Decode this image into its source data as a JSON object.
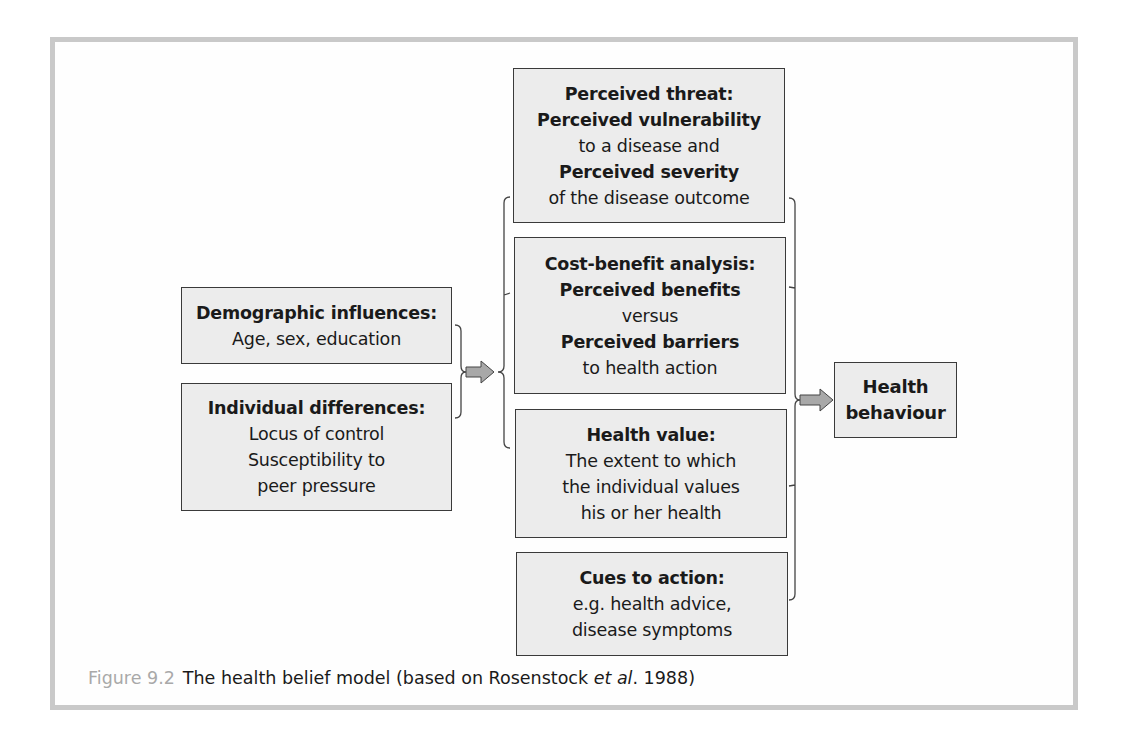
{
  "diagram": {
    "left_boxes": [
      {
        "title": "Demographic influences:",
        "lines": [
          "Age, sex, education"
        ]
      },
      {
        "title": "Individual differences:",
        "lines": [
          "Locus of control",
          "Susceptibility to",
          "peer pressure"
        ]
      }
    ],
    "middle_boxes": [
      {
        "lines": [
          {
            "text": "Perceived threat:",
            "bold": true
          },
          {
            "text": "Perceived vulnerability",
            "bold": true
          },
          {
            "text": "to a disease and",
            "bold": false
          },
          {
            "text": "Perceived severity",
            "bold": true
          },
          {
            "text": "of the disease outcome",
            "bold": false
          }
        ]
      },
      {
        "lines": [
          {
            "text": "Cost-benefit analysis:",
            "bold": true
          },
          {
            "text": "Perceived benefits",
            "bold": true
          },
          {
            "text": "versus",
            "bold": false
          },
          {
            "text": "Perceived barriers",
            "bold": true
          },
          {
            "text": "to health action",
            "bold": false
          }
        ]
      },
      {
        "lines": [
          {
            "text": "Health value:",
            "bold": true
          },
          {
            "text": "The extent to which",
            "bold": false
          },
          {
            "text": "the individual values",
            "bold": false
          },
          {
            "text": "his or her health",
            "bold": false
          }
        ]
      },
      {
        "lines": [
          {
            "text": "Cues to action:",
            "bold": true
          },
          {
            "text": "e.g. health advice,",
            "bold": false
          },
          {
            "text": "disease symptoms",
            "bold": false
          }
        ]
      }
    ],
    "outcome_box": {
      "lines": [
        "Health",
        "behaviour"
      ]
    },
    "arrows": [
      {
        "from": "left_boxes",
        "to": "middle_boxes"
      },
      {
        "from": "middle_boxes",
        "to": "outcome_box"
      }
    ],
    "colors": {
      "box_fill": "#ececec",
      "box_border": "#3a3a3a",
      "arrow_fill": "#a8a8a8",
      "frame_border": "#c9c9c9",
      "figure_label": "#a9a9a9"
    }
  },
  "caption": {
    "figure_label": "Figure 9.2",
    "text_before": "The health belief model (based on Rosenstock ",
    "text_italic": "et al",
    "text_after": ". 1988)"
  }
}
